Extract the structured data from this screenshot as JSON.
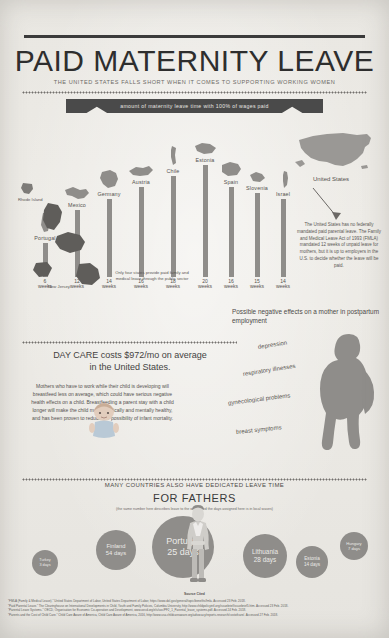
{
  "header": {
    "title": "PAID MATERNITY LEAVE",
    "subtitle": "THE UNITED STATES FALLS SHORT WHEN IT COMES TO SUPPORTING WORKING WOMEN",
    "banner": "amount of maternity leave time with 100% of wages paid"
  },
  "chart_data": {
    "type": "bar",
    "title": "amount of maternity leave time with 100% of wages paid",
    "xlabel": "",
    "ylabel": "weeks of fully paid maternity leave",
    "ylim": [
      0,
      20
    ],
    "unit": "weeks",
    "categories": [
      "Portugal",
      "Mexico",
      "Germany",
      "Austria",
      "Chile",
      "Estonia",
      "Spain",
      "Slovenia",
      "Israel",
      "United States"
    ],
    "values": [
      6,
      12,
      14,
      16,
      18,
      20,
      16,
      15,
      14,
      0
    ],
    "labels": [
      "6 weeks",
      "12 weeks",
      "14 weeks",
      "16 weeks",
      "18 weeks",
      "20 weeks",
      "16 weeks",
      "15 weeks",
      "14 weeks",
      "0 weeks"
    ],
    "grid": false,
    "legend": false
  },
  "bars": [
    {
      "country": "Portugal",
      "weeks": 6,
      "value_line1": "6",
      "value_line2": "weeks"
    },
    {
      "country": "Mexico",
      "weeks": 12,
      "value_line1": "12",
      "value_line2": "weeks"
    },
    {
      "country": "Germany",
      "weeks": 14,
      "value_line1": "14",
      "value_line2": "weeks"
    },
    {
      "country": "Austria",
      "weeks": 16,
      "value_line1": "16",
      "value_line2": "weeks"
    },
    {
      "country": "Chile",
      "weeks": 18,
      "value_line1": "18",
      "value_line2": "weeks"
    },
    {
      "country": "Estonia",
      "weeks": 20,
      "value_line1": "20",
      "value_line2": "weeks"
    },
    {
      "country": "Spain",
      "weeks": 16,
      "value_line1": "16",
      "value_line2": "weeks"
    },
    {
      "country": "Slovenia",
      "weeks": 15,
      "value_line1": "15",
      "value_line2": "weeks"
    },
    {
      "country": "Israel",
      "weeks": 14,
      "value_line1": "14",
      "value_line2": "weeks"
    }
  ],
  "us": {
    "label": "United States",
    "note": "The United States has no federally mandated paid parental leave. The Family and Medical Leave Act of 1993 (FMLA) mandated 12 weeks of unpaid leave for mothers, but it is up to employers in the U.S. to decide whether the leave will be paid."
  },
  "states": {
    "note": "Only four states provide paid family and medical leave through the public sector",
    "items": [
      {
        "name": "Rhode Island"
      },
      {
        "name": "New Jersey"
      },
      {
        "name": "New York"
      },
      {
        "name": "California"
      }
    ]
  },
  "daycare": {
    "line1": "DAY CARE costs $972/mo on average",
    "line2": "in the United States.",
    "body": "Mothers who have to work while their child is developing will breastfeed less on average, which could have serious negative health effects on a child. Breastfeeding a parent stay with a child longer will make the child more physically and mentally healthy, and has been proven to reduce the possibility of infant mortality."
  },
  "effects": {
    "title": "Possible negative effects on a mother in postpartum employment",
    "items": [
      "depression",
      "respiratory illnesses",
      "gynecological problems",
      "breast symptoms"
    ]
  },
  "fathers": {
    "headline": "MANY COUNTRIES ALSO HAVE DEDICATED LEAVE TIME",
    "title": "FOR FATHERS",
    "note": "(the same number here describes leave to the week, and the days assigned here is in local waves)",
    "bubbles": [
      {
        "country": "Turkey",
        "days": "3 days",
        "size": 26
      },
      {
        "country": "Finland",
        "days": "54 days",
        "size": 40
      },
      {
        "country": "Portugal",
        "days": "25 days",
        "size": 62
      },
      {
        "country": "Lithuania",
        "days": "28 days",
        "size": 44
      },
      {
        "country": "Estonia",
        "days": "14 days",
        "size": 32
      },
      {
        "country": "Hungary",
        "days": "7 days",
        "size": 28
      }
    ]
  },
  "sources": {
    "heading": "Source Cited",
    "lines": [
      "\"FMLA (Family & Medical Leave).\" United States Department of Labor, United States Department of Labor, https://www.dol.gov/general/topic/benefits/fmla. Accessed 23 Feb. 2018.",
      "\"Paid Parental Leave.\" The Clearinghouse on International Developments in Child, Youth and Family Policies, Columbia University, http://www.childpolicyintl.org/issuebrief/issuebrief5.htm. Accessed 23 Feb. 2018.",
      "\"Parental Leave Systems.\" OECD, Organisation for Economic Co-operation and Development, www.oecd.org/els/soc/PF2_1_Parental_leave_systems.pdf. Accessed 24 Feb. 2018.",
      "\"Parents and the Cost of Child Care.\" Child Care Aware of America, Child Care Aware of America, 2016, http://www.usa.childcareaware.org/advocacy/reports-research/costofcare/. Accessed 27 Feb. 2018."
    ]
  },
  "colors": {
    "background": "#eceae6",
    "ink": "#3a3a3a",
    "bar": "#8f8d8a",
    "banner": "#4a4a4a"
  }
}
